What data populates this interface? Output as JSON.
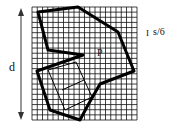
{
  "labels": {
    "dimension": "d",
    "point": "P",
    "scale": "s/6",
    "scale_marker": "I"
  },
  "grid": {
    "x0": 32,
    "y0": 7,
    "x1": 137,
    "y1": 120,
    "cols": 20,
    "rows": 22,
    "color": "#111111"
  },
  "shape": {
    "outer_polygon": "38,12 78,7 118,32 134,71 100,84 88,105 80,120 50,110 37,71 83,55 48,50",
    "inner_polygon": "48,70 76,62 92,97 65,110",
    "inner_mid": "62,90 84,80"
  },
  "arrow": {
    "x": 21,
    "y_top": 8,
    "y_bottom": 120
  }
}
